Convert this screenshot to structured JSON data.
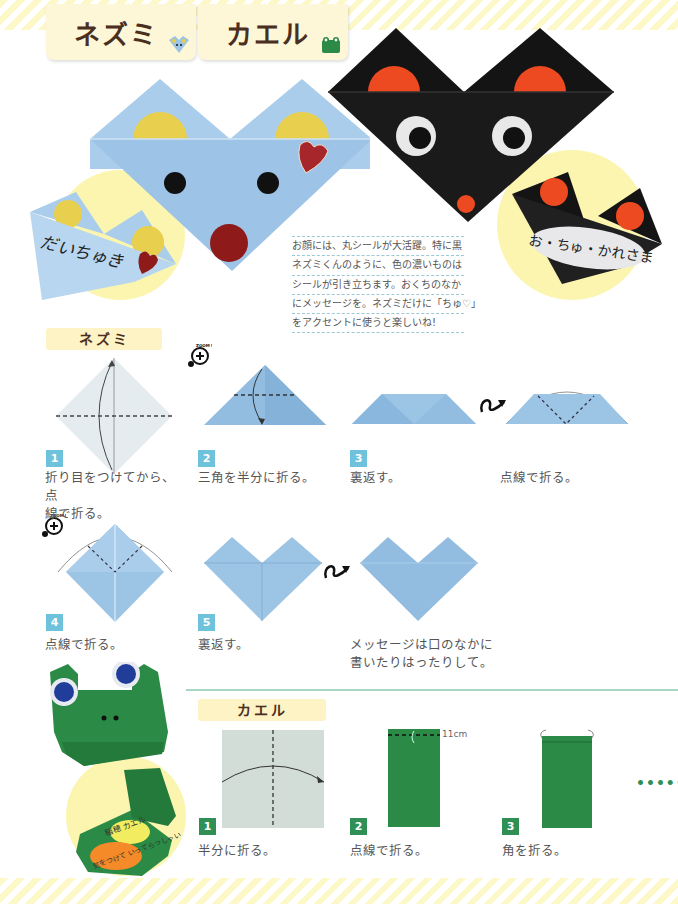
{
  "header": {
    "tabs": [
      {
        "label": "ネズミ",
        "icon": "mouse-icon"
      },
      {
        "label": "カエル",
        "icon": "frog-icon"
      }
    ]
  },
  "photos": {
    "blue_mouse_message": "だいちゅき",
    "black_mouse_message": "お・ちゅ・かれさま",
    "frog_message_yellow": "稲穂 カエル",
    "frog_message_orange": "気をつけて いってらっしゃい"
  },
  "note": {
    "lines": [
      "お顔には、丸シールが大活躍。特に黒",
      "ネズミくんのように、色の濃いものは",
      "シールが引き立ちます。おくちのなか",
      "にメッセージを。ネズミだけに「ちゅ♡」",
      "をアクセントに使うと楽しいね!"
    ]
  },
  "mouse_section": {
    "label": "ネズミ",
    "zoom_badge": "ZOOM UP",
    "steps": [
      {
        "num": "1",
        "caption_l1": "折り目をつけてから、点",
        "caption_l2": "線で折る。"
      },
      {
        "num": "2",
        "caption_l1": "三角を半分に折る。"
      },
      {
        "num": "3",
        "caption_l1": "裏返す。"
      },
      {
        "num": "",
        "caption_l1": "点線で折る。"
      },
      {
        "num": "4",
        "caption_l1": "点線で折る。"
      },
      {
        "num": "5",
        "caption_l1": "裏返す。"
      },
      {
        "num": "",
        "caption_l1": "メッセージは口のなかに",
        "caption_l2": "書いたりはったりして。"
      }
    ]
  },
  "frog_section": {
    "label": "カエル",
    "measure": "11cm",
    "continue_marker": "••••••",
    "steps": [
      {
        "num": "1",
        "caption": "半分に折る。"
      },
      {
        "num": "2",
        "caption": "点線で折る。"
      },
      {
        "num": "3",
        "caption": "角を折る。"
      }
    ]
  },
  "colors": {
    "paper_blue": "#9cc4e4",
    "paper_black": "#141414",
    "paper_green": "#2b8a45",
    "sticker_yellow": "#e8cd48",
    "sticker_red": "#ee4a22",
    "title_brown": "#4a2e1e",
    "badge_blue": "#6fc2dc",
    "badge_green": "#2f8f55",
    "highlight_yellow": "#fdf3c4"
  }
}
